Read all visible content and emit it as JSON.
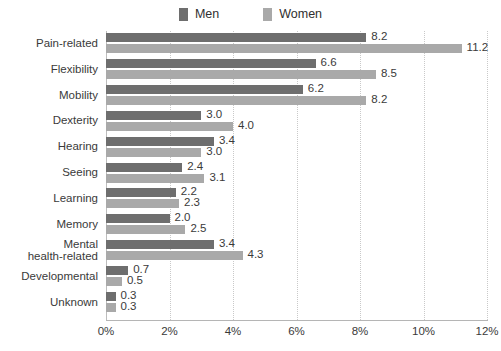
{
  "legend": {
    "position": "top-center",
    "entries": [
      {
        "label": "Men",
        "color": "#6e6e6e",
        "swatch_icon": "square-swatch-icon"
      },
      {
        "label": "Women",
        "color": "#a9a9a9",
        "swatch_icon": "square-swatch-icon"
      }
    ]
  },
  "chart_data": {
    "type": "bar",
    "orientation": "horizontal",
    "grouped": true,
    "title": "",
    "subtitle": "",
    "xlabel": "",
    "ylabel": "",
    "xlim": [
      0,
      12
    ],
    "xtick_labels": [
      "0%",
      "2%",
      "4%",
      "6%",
      "8%",
      "10%",
      "12%"
    ],
    "xtick_values": [
      0,
      2,
      4,
      6,
      8,
      10,
      12
    ],
    "grid": "vertical-dotted",
    "value_labels": true,
    "categories": [
      "Pain-related",
      "Flexibility",
      "Mobility",
      "Dexterity",
      "Hearing",
      "Seeing",
      "Learning",
      "Memory",
      "Mental health-related",
      "Developmental",
      "Unknown"
    ],
    "category_label_lines": [
      [
        "Pain-related"
      ],
      [
        "Flexibility"
      ],
      [
        "Mobility"
      ],
      [
        "Dexterity"
      ],
      [
        "Hearing"
      ],
      [
        "Seeing"
      ],
      [
        "Learning"
      ],
      [
        "Memory"
      ],
      [
        "Mental",
        "health-related"
      ],
      [
        "Developmental"
      ],
      [
        "Unknown"
      ]
    ],
    "series": [
      {
        "name": "Men",
        "color": "#6e6e6e",
        "values": [
          8.2,
          6.6,
          6.2,
          3.0,
          3.4,
          2.4,
          2.2,
          2.0,
          3.4,
          0.7,
          0.3
        ],
        "labels": [
          "8.2",
          "6.6",
          "6.2",
          "3.0",
          "3.4",
          "2.4",
          "2.2",
          "2.0",
          "3.4",
          "0.7",
          "0.3"
        ]
      },
      {
        "name": "Women",
        "color": "#a9a9a9",
        "values": [
          11.2,
          8.5,
          8.2,
          4.0,
          3.0,
          3.1,
          2.3,
          2.5,
          4.3,
          0.5,
          0.3
        ],
        "labels": [
          "11.2",
          "8.5",
          "8.2",
          "4.0",
          "3.0",
          "3.1",
          "2.3",
          "2.5",
          "4.3",
          "0.5",
          "0.3"
        ]
      }
    ]
  },
  "colors": {
    "men": "#6e6e6e",
    "women": "#a9a9a9",
    "gridline": "#c9c9c9",
    "axis": "#b5b5b5",
    "text": "#3a3a3a",
    "background": "#ffffff"
  }
}
